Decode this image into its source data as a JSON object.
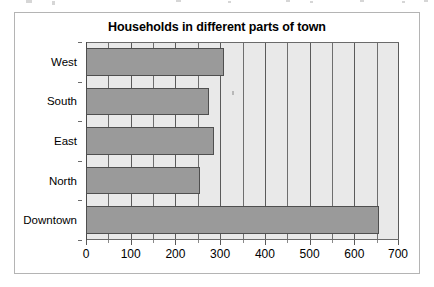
{
  "chart_data": {
    "type": "bar",
    "orientation": "horizontal",
    "title": "Households in different parts of town",
    "xlabel": "",
    "ylabel": "",
    "categories": [
      "West",
      "South",
      "East",
      "North",
      "Downtown"
    ],
    "values": [
      308,
      275,
      287,
      255,
      655
    ],
    "xlim": [
      0,
      700
    ],
    "xticks": [
      0,
      100,
      200,
      300,
      400,
      500,
      600,
      700
    ],
    "xtick_labels": [
      "0",
      "100",
      "200",
      "300",
      "400",
      "500",
      "600",
      "700"
    ],
    "minor_tick_step": 50,
    "grid": true,
    "grid_axis": "x",
    "legend": null,
    "series": [
      {
        "name": "Households",
        "values": [
          308,
          275,
          287,
          255,
          655
        ]
      }
    ],
    "colors": {
      "bar_fill": "#9a9a9a",
      "bar_edge": "#4f4f4f",
      "plot_background": "#e9e9e9",
      "grid": "#6e6e6e",
      "page_background": "#ffffff",
      "frame": "#b4b4b4",
      "text": "#000000"
    }
  }
}
